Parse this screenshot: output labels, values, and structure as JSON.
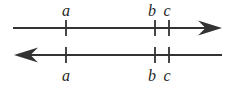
{
  "figure": {
    "type": "number-line-diagram",
    "stroke_color": "#333333",
    "label_color": "#262626",
    "background_color": "#ffffff",
    "width": 236,
    "height": 88,
    "lines": [
      {
        "id": "top-number-line",
        "name": "upper-number-line",
        "y": 28,
        "x_start": 13,
        "x_end": 222,
        "arrow_direction": "right",
        "arrow_at": "end",
        "labels_position": "above"
      },
      {
        "id": "bottom-number-line",
        "name": "lower-number-line",
        "y": 55,
        "x_start": 14,
        "x_end": 222,
        "arrow_direction": "left",
        "arrow_at": "start",
        "labels_position": "below"
      }
    ],
    "ticks": [
      {
        "label": "a",
        "x": 66
      },
      {
        "label": "b",
        "x": 155
      },
      {
        "label": "c",
        "x": 169
      }
    ],
    "top_labels": [
      {
        "text": "a",
        "x": 66,
        "y": 3
      },
      {
        "text": "b",
        "x": 152,
        "y": 3
      },
      {
        "text": "c",
        "x": 167,
        "y": 3
      }
    ],
    "bottom_labels": [
      {
        "text": "a",
        "x": 66,
        "y": 68
      },
      {
        "text": "b",
        "x": 152,
        "y": 68
      },
      {
        "text": "c",
        "x": 167,
        "y": 68
      }
    ]
  }
}
